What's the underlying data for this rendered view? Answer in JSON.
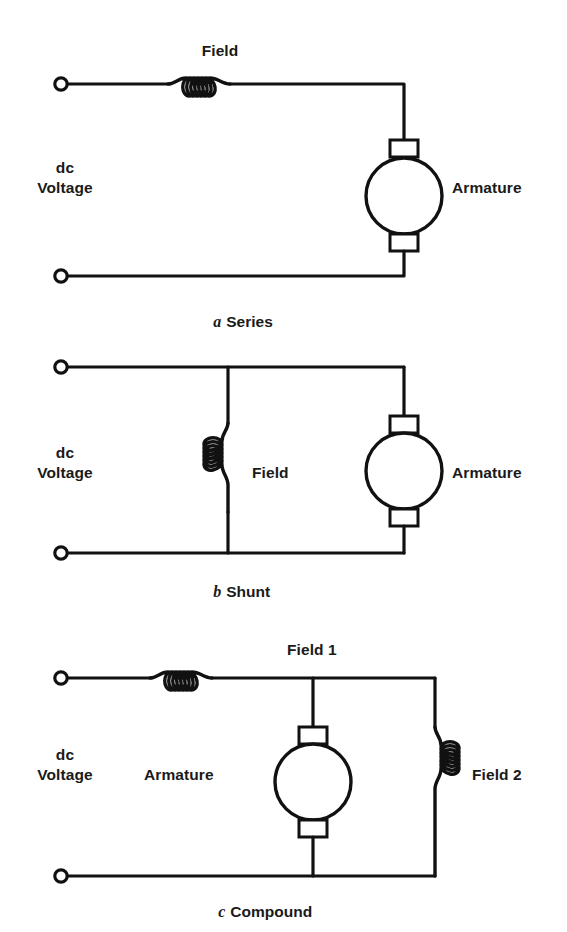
{
  "figure": {
    "background_color": "#ffffff",
    "line_color": "#111111"
  },
  "circuits": [
    {
      "id": "series",
      "caption_index": "a",
      "caption_text": "Series",
      "source_label_line1": "dc",
      "source_label_line2": "Voltage",
      "field_label": "Field",
      "armature_label": "Armature",
      "coil_turns": 6,
      "coil_orientation": "horizontal",
      "terminals": 2
    },
    {
      "id": "shunt",
      "caption_index": "b",
      "caption_text": "Shunt",
      "source_label_line1": "dc",
      "source_label_line2": "Voltage",
      "field_label": "Field",
      "armature_label": "Armature",
      "coil_turns": 6,
      "coil_orientation": "vertical",
      "terminals": 2
    },
    {
      "id": "compound",
      "caption_index": "c",
      "caption_text": "Compound",
      "source_label_line1": "dc",
      "source_label_line2": "Voltage",
      "field1_label": "Field 1",
      "field2_label": "Field 2",
      "armature_label": "Armature",
      "coil1_turns": 6,
      "coil1_orientation": "horizontal",
      "coil2_turns": 6,
      "coil2_orientation": "vertical",
      "terminals": 2
    }
  ]
}
